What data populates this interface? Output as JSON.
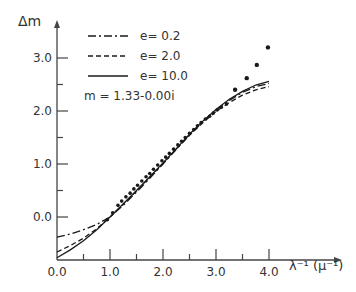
{
  "chart_data": {
    "type": "line",
    "title": "",
    "xlabel": "λ⁻¹ (μ⁻¹)",
    "ylabel": "Δm",
    "xlim": [
      0.0,
      4.3
    ],
    "ylim": [
      -0.8,
      3.4
    ],
    "x_ticks": [
      0.0,
      1.0,
      2.0,
      3.0,
      4.0
    ],
    "x_tick_labels": [
      "0.0",
      "1.0",
      "2.0",
      "3.0",
      "4.0"
    ],
    "x_minor_ticks": [
      0.5,
      1.5,
      2.5,
      3.5
    ],
    "y_ticks": [
      0.0,
      1.0,
      2.0,
      3.0
    ],
    "y_tick_labels": [
      "0.0",
      "1.0",
      "2.0",
      "3.0"
    ],
    "y_minor_ticks": [
      0.5,
      1.5,
      2.5
    ],
    "grid": false,
    "legend_position": "upper-left",
    "annotation": "m = 1.33-0.00i",
    "series": [
      {
        "name": "e = 0.2",
        "style": "dash-dot",
        "x": [
          0.0,
          0.25,
          0.5,
          0.75,
          1.0,
          1.25,
          1.5,
          1.75,
          2.0,
          2.25,
          2.5,
          2.75,
          3.0,
          3.25,
          3.5,
          3.75,
          4.0
        ],
        "y": [
          -0.38,
          -0.32,
          -0.24,
          -0.14,
          0.0,
          0.22,
          0.47,
          0.73,
          1.0,
          1.28,
          1.55,
          1.8,
          2.02,
          2.2,
          2.35,
          2.46,
          2.52
        ]
      },
      {
        "name": "e = 2.0",
        "style": "dashed",
        "x": [
          0.0,
          0.25,
          0.5,
          0.75,
          1.0,
          1.25,
          1.5,
          1.75,
          2.0,
          2.25,
          2.5,
          2.75,
          3.0,
          3.25,
          3.5,
          3.75,
          4.0
        ],
        "y": [
          -0.66,
          -0.54,
          -0.4,
          -0.22,
          0.0,
          0.24,
          0.49,
          0.75,
          1.01,
          1.28,
          1.54,
          1.78,
          1.99,
          2.16,
          2.3,
          2.4,
          2.46
        ]
      },
      {
        "name": "e = 10.0",
        "style": "solid",
        "x": [
          0.0,
          0.25,
          0.5,
          0.75,
          1.0,
          1.25,
          1.5,
          1.75,
          2.0,
          2.25,
          2.5,
          2.75,
          3.0,
          3.25,
          3.5,
          3.75,
          4.0
        ],
        "y": [
          -0.77,
          -0.62,
          -0.45,
          -0.24,
          0.0,
          0.25,
          0.5,
          0.76,
          1.02,
          1.29,
          1.56,
          1.81,
          2.03,
          2.22,
          2.37,
          2.49,
          2.56
        ]
      },
      {
        "name": "observed",
        "style": "points",
        "x": [
          0.95,
          1.05,
          1.15,
          1.22,
          1.3,
          1.38,
          1.45,
          1.52,
          1.6,
          1.68,
          1.75,
          1.82,
          1.9,
          1.98,
          2.05,
          2.12,
          2.2,
          2.28,
          2.35,
          2.42,
          2.5,
          2.58,
          2.65,
          2.72,
          2.8,
          2.88,
          2.95,
          3.02,
          3.1,
          3.2,
          3.36,
          3.58,
          3.77,
          3.98
        ],
        "y": [
          -0.05,
          0.08,
          0.22,
          0.3,
          0.38,
          0.45,
          0.53,
          0.6,
          0.68,
          0.76,
          0.82,
          0.9,
          0.98,
          1.06,
          1.13,
          1.2,
          1.28,
          1.36,
          1.43,
          1.5,
          1.58,
          1.65,
          1.72,
          1.78,
          1.85,
          1.9,
          1.96,
          2.02,
          2.07,
          2.13,
          2.4,
          2.62,
          2.87,
          3.2
        ]
      }
    ]
  },
  "legend": {
    "items": [
      {
        "label": "e= 0.2",
        "style": "dash-dot"
      },
      {
        "label": "e= 2.0",
        "style": "dashed"
      },
      {
        "label": "e= 10.0",
        "style": "solid"
      }
    ],
    "annotation": "m = 1.33-0.00i"
  },
  "axes": {
    "ylabel": "Δm",
    "xlabel": "λ⁻¹ (μ⁻¹)",
    "x_tick_labels": [
      "0.0",
      "1.0",
      "2.0",
      "3.0",
      "4.0"
    ],
    "y_tick_labels": [
      "0.0",
      "1.0",
      "2.0",
      "3.0"
    ]
  },
  "colors": {
    "ink": "#1a1a1a",
    "axis": "#444444",
    "background": "#ffffff"
  }
}
